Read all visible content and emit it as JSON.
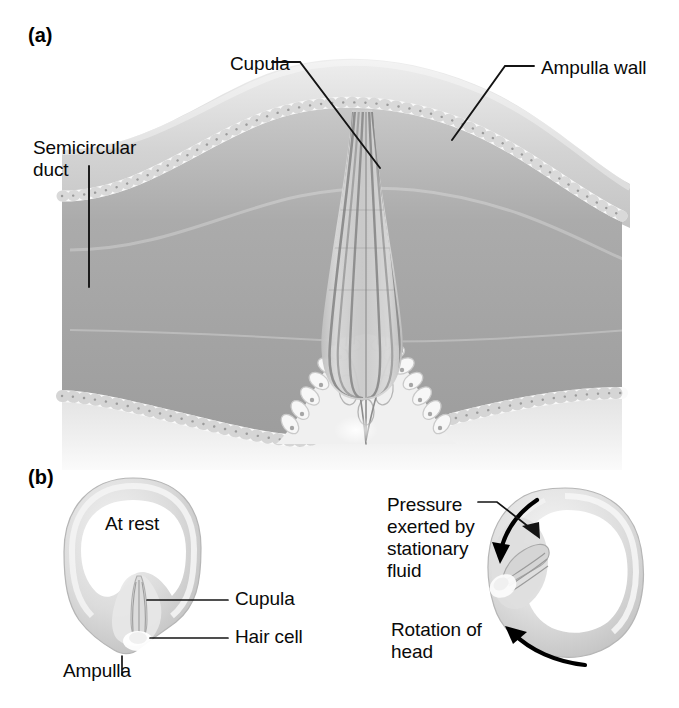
{
  "figure": {
    "type": "anatomical-illustration",
    "panels": [
      {
        "tag": "(a)",
        "description": "Longitudinal section of the ampulla showing the cupula rising from the crista into the lumen",
        "labels": [
          {
            "id": "cupula",
            "text": "Cupula"
          },
          {
            "id": "ampulla_wall",
            "text": "Ampulla wall"
          },
          {
            "id": "semicircular_duct",
            "text": "Semicircular\nduct"
          }
        ]
      },
      {
        "tag": "(b)",
        "description": "Two cross-sections of the semicircular duct ring: at rest and during head rotation",
        "left_diagram": {
          "state_label": "At rest",
          "labels": [
            {
              "id": "cupula",
              "text": "Cupula"
            },
            {
              "id": "hair_cell",
              "text": "Hair cell"
            },
            {
              "id": "ampulla",
              "text": "Ampulla"
            }
          ]
        },
        "right_diagram": {
          "labels": [
            {
              "id": "pressure",
              "text": "Pressure\nexerted by\nstationary\nfluid"
            },
            {
              "id": "rotation",
              "text": "Rotation of\nhead"
            }
          ]
        }
      }
    ],
    "colors": {
      "background": "#ffffff",
      "text": "#0a0a0a",
      "leader_line": "#1a1a1a",
      "lumen_gray": "#a9a9a9",
      "wall_light": "#d9d9d9",
      "wall_mid": "#c2c2c2",
      "epithelium": "#f2f2f2",
      "cupula_gray": "#cfcfcf",
      "cupula_stripe": "#9a9a9a",
      "arrow": "#000000"
    }
  }
}
